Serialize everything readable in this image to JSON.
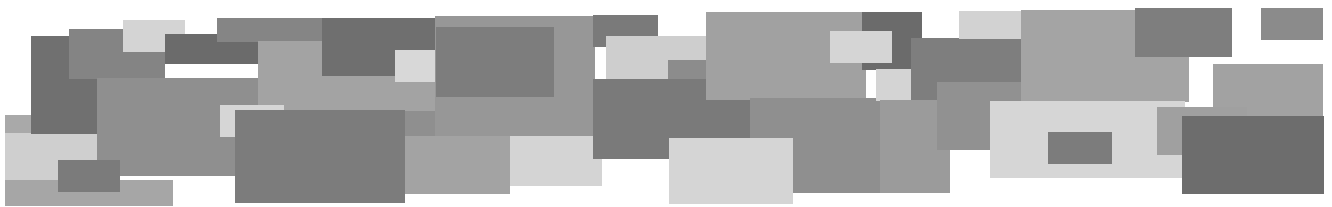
{
  "canvas": {
    "width": 1332,
    "height": 207,
    "background": "#ffffff"
  },
  "palette": {
    "darkest": "#646464",
    "dark": "#727272",
    "mid_dark": "#808080",
    "mid": "#8e8e8e",
    "mid_light": "#a0a0a0",
    "light": "#b4b4b4",
    "lightest": "#d3d3d3"
  },
  "rects": [
    {
      "x": 5,
      "y": 115,
      "w": 28,
      "h": 20,
      "color": "#a9a9a9"
    },
    {
      "x": 5,
      "y": 133,
      "w": 96,
      "h": 50,
      "color": "#cfcfcf"
    },
    {
      "x": 5,
      "y": 180,
      "w": 168,
      "h": 26,
      "color": "#a6a6a6"
    },
    {
      "x": 31,
      "y": 36,
      "w": 68,
      "h": 98,
      "color": "#707070"
    },
    {
      "x": 69,
      "y": 29,
      "w": 96,
      "h": 50,
      "color": "#848484"
    },
    {
      "x": 97,
      "y": 78,
      "w": 400,
      "h": 98,
      "color": "#8f8f8f"
    },
    {
      "x": 123,
      "y": 20,
      "w": 62,
      "h": 32,
      "color": "#d4d4d4"
    },
    {
      "x": 165,
      "y": 34,
      "w": 130,
      "h": 30,
      "color": "#6b6b6b"
    },
    {
      "x": 58,
      "y": 160,
      "w": 62,
      "h": 32,
      "color": "#7b7b7b"
    },
    {
      "x": 217,
      "y": 18,
      "w": 105,
      "h": 24,
      "color": "#858585"
    },
    {
      "x": 258,
      "y": 41,
      "w": 200,
      "h": 70,
      "color": "#a3a3a3"
    },
    {
      "x": 322,
      "y": 18,
      "w": 114,
      "h": 58,
      "color": "#6f6f6f"
    },
    {
      "x": 395,
      "y": 50,
      "w": 64,
      "h": 32,
      "color": "#d8d8d8"
    },
    {
      "x": 435,
      "y": 16,
      "w": 160,
      "h": 120,
      "color": "#979797"
    },
    {
      "x": 436,
      "y": 27,
      "w": 118,
      "h": 70,
      "color": "#7d7d7d"
    },
    {
      "x": 593,
      "y": 15,
      "w": 65,
      "h": 32,
      "color": "#7a7a7a"
    },
    {
      "x": 606,
      "y": 36,
      "w": 100,
      "h": 44,
      "color": "#cecece"
    },
    {
      "x": 668,
      "y": 60,
      "w": 40,
      "h": 22,
      "color": "#8c8c8c"
    },
    {
      "x": 220,
      "y": 105,
      "w": 64,
      "h": 32,
      "color": "#d6d6d6"
    },
    {
      "x": 235,
      "y": 110,
      "w": 170,
      "h": 93,
      "color": "#7c7c7c"
    },
    {
      "x": 405,
      "y": 136,
      "w": 105,
      "h": 58,
      "color": "#a3a3a3"
    },
    {
      "x": 510,
      "y": 136,
      "w": 92,
      "h": 50,
      "color": "#d4d4d4"
    },
    {
      "x": 593,
      "y": 79,
      "w": 160,
      "h": 80,
      "color": "#7a7a7a"
    },
    {
      "x": 706,
      "y": 12,
      "w": 160,
      "h": 88,
      "color": "#a1a1a1"
    },
    {
      "x": 750,
      "y": 98,
      "w": 190,
      "h": 95,
      "color": "#8f8f8f"
    },
    {
      "x": 669,
      "y": 138,
      "w": 124,
      "h": 66,
      "color": "#d5d5d5"
    },
    {
      "x": 862,
      "y": 12,
      "w": 60,
      "h": 58,
      "color": "#6b6b6b"
    },
    {
      "x": 830,
      "y": 31,
      "w": 62,
      "h": 32,
      "color": "#d5d5d5"
    },
    {
      "x": 876,
      "y": 69,
      "w": 35,
      "h": 32,
      "color": "#d4d4d4"
    },
    {
      "x": 911,
      "y": 38,
      "w": 110,
      "h": 72,
      "color": "#7e7e7e"
    },
    {
      "x": 880,
      "y": 100,
      "w": 70,
      "h": 93,
      "color": "#9b9b9b"
    },
    {
      "x": 937,
      "y": 82,
      "w": 120,
      "h": 68,
      "color": "#919191"
    },
    {
      "x": 959,
      "y": 11,
      "w": 62,
      "h": 28,
      "color": "#d2d2d2"
    },
    {
      "x": 1021,
      "y": 10,
      "w": 168,
      "h": 92,
      "color": "#a4a4a4"
    },
    {
      "x": 990,
      "y": 101,
      "w": 195,
      "h": 77,
      "color": "#d6d6d6"
    },
    {
      "x": 1048,
      "y": 132,
      "w": 64,
      "h": 32,
      "color": "#7c7c7c"
    },
    {
      "x": 1135,
      "y": 8,
      "w": 97,
      "h": 49,
      "color": "#7e7e7e"
    },
    {
      "x": 1261,
      "y": 8,
      "w": 62,
      "h": 32,
      "color": "#8b8b8b"
    },
    {
      "x": 1213,
      "y": 64,
      "w": 110,
      "h": 58,
      "color": "#a2a2a2"
    },
    {
      "x": 1157,
      "y": 107,
      "w": 90,
      "h": 48,
      "color": "#a0a0a0"
    },
    {
      "x": 1182,
      "y": 116,
      "w": 142,
      "h": 78,
      "color": "#6d6d6d"
    }
  ]
}
